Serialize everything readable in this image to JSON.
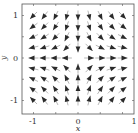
{
  "chart_data": {
    "type": "quiver",
    "title": "",
    "xlabel": "x",
    "ylabel": "y",
    "xlim": [
      -1.25,
      1.27
    ],
    "ylim": [
      -1.3,
      1.27
    ],
    "xticks": [
      -1,
      0,
      1
    ],
    "yticks": [
      -1,
      0,
      1
    ],
    "xtick_labels": [
      "-1",
      "0",
      "1"
    ],
    "ytick_labels": [
      "-1",
      "0",
      "1"
    ],
    "grid": false,
    "field": "(x, -y)",
    "grid_points": [
      -1,
      -0.75,
      -0.5,
      -0.25,
      0,
      0.25,
      0.5,
      0.75,
      1
    ],
    "arrow_length": "normalized (equal length)",
    "arrow_color": "#2a2a2a"
  }
}
